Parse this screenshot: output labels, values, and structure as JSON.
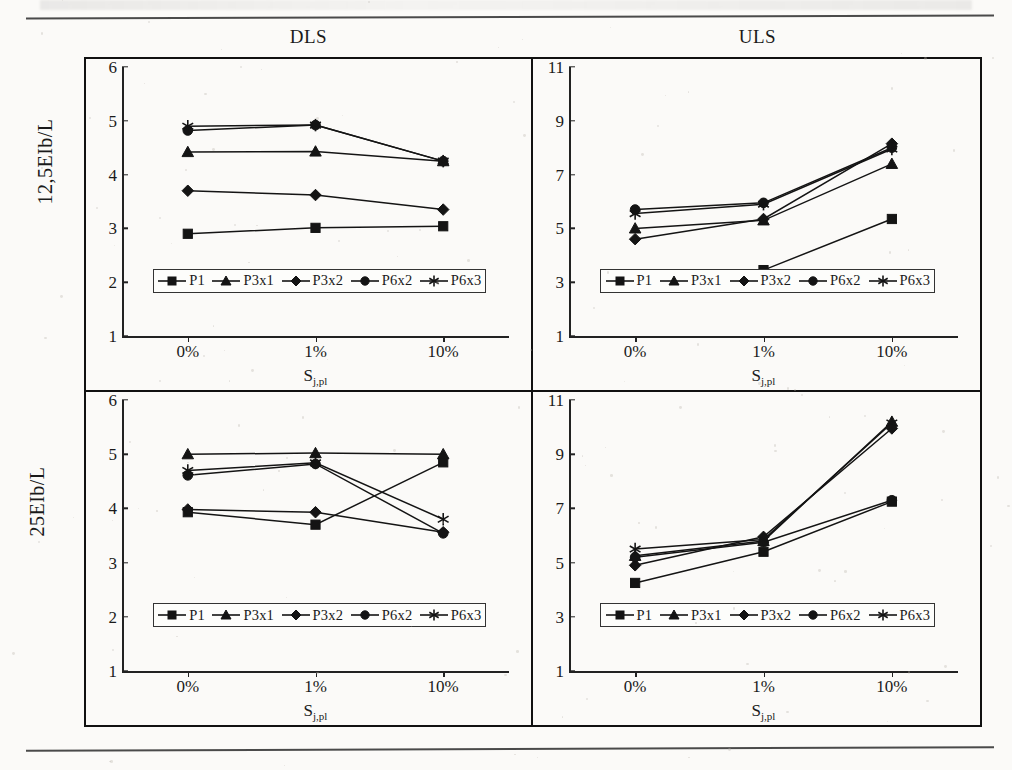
{
  "figure": {
    "column_headers": [
      "DLS",
      "ULS"
    ],
    "row_labels": [
      "12,5EIb/L",
      "25EIb/L"
    ],
    "x_axis_title_base": "S",
    "x_axis_title_sub": "j,pl",
    "categories": [
      "0%",
      "1%",
      "10%"
    ],
    "line_color": "#141414"
  },
  "legend": {
    "items": [
      {
        "label": "P1",
        "marker": "square-marker"
      },
      {
        "label": "P3x1",
        "marker": "triangle-marker"
      },
      {
        "label": "P3x2",
        "marker": "diamond-marker"
      },
      {
        "label": "P6x2",
        "marker": "circle-marker"
      },
      {
        "label": "P6x3",
        "marker": "asterisk-marker"
      }
    ]
  },
  "chart_data": [
    {
      "type": "line",
      "title": "DLS",
      "panel": "top-left",
      "ylabel": "12,5EIb/L",
      "xlabel": "Sj,pl",
      "categories": [
        "0%",
        "1%",
        "10%"
      ],
      "yticks": [
        1,
        2,
        3,
        4,
        5,
        6
      ],
      "ylim": [
        1,
        6
      ],
      "grid": false,
      "legend_position": "inside-bottom",
      "series": [
        {
          "name": "P1",
          "marker": "square",
          "values": [
            2.9,
            3.01,
            3.04
          ]
        },
        {
          "name": "P3x1",
          "marker": "triangle",
          "values": [
            4.42,
            4.43,
            4.25
          ]
        },
        {
          "name": "P3x2",
          "marker": "diamond",
          "values": [
            3.7,
            3.62,
            3.35
          ]
        },
        {
          "name": "P6x2",
          "marker": "circle",
          "values": [
            4.82,
            4.92,
            4.25
          ]
        },
        {
          "name": "P6x3",
          "marker": "asterisk",
          "values": [
            4.9,
            4.92,
            4.25
          ]
        }
      ]
    },
    {
      "type": "line",
      "title": "ULS",
      "panel": "top-right",
      "ylabel": "12,5EIb/L",
      "xlabel": "Sj,pl",
      "categories": [
        "0%",
        "1%",
        "10%"
      ],
      "yticks": [
        1,
        3,
        5,
        7,
        9,
        11
      ],
      "ylim": [
        1,
        11
      ],
      "grid": false,
      "legend_position": "inside-bottom",
      "series": [
        {
          "name": "P1",
          "marker": "square",
          "values": [
            3.25,
            3.45,
            5.35
          ]
        },
        {
          "name": "P3x1",
          "marker": "triangle",
          "values": [
            5.0,
            5.3,
            7.4
          ]
        },
        {
          "name": "P3x2",
          "marker": "diamond",
          "values": [
            4.6,
            5.35,
            8.15
          ]
        },
        {
          "name": "P6x2",
          "marker": "circle",
          "values": [
            5.7,
            5.95,
            8.0
          ]
        },
        {
          "name": "P6x3",
          "marker": "asterisk",
          "values": [
            5.55,
            5.9,
            7.95
          ]
        }
      ]
    },
    {
      "type": "line",
      "title": "DLS",
      "panel": "bottom-left",
      "ylabel": "25EIb/L",
      "xlabel": "Sj,pl",
      "categories": [
        "0%",
        "1%",
        "10%"
      ],
      "yticks": [
        1,
        2,
        3,
        4,
        5,
        6
      ],
      "ylim": [
        1,
        6
      ],
      "grid": false,
      "legend_position": "inside-bottom",
      "series": [
        {
          "name": "P1",
          "marker": "square",
          "values": [
            3.93,
            3.7,
            4.85
          ]
        },
        {
          "name": "P3x1",
          "marker": "triangle",
          "values": [
            5.0,
            5.02,
            5.0
          ]
        },
        {
          "name": "P3x2",
          "marker": "diamond",
          "values": [
            3.98,
            3.93,
            3.56
          ]
        },
        {
          "name": "P6x2",
          "marker": "circle",
          "values": [
            4.61,
            4.82,
            3.54
          ]
        },
        {
          "name": "P6x3",
          "marker": "asterisk",
          "values": [
            4.7,
            4.84,
            3.8
          ]
        }
      ]
    },
    {
      "type": "line",
      "title": "ULS",
      "panel": "bottom-right",
      "ylabel": "25EIb/L",
      "xlabel": "Sj,pl",
      "categories": [
        "0%",
        "1%",
        "10%"
      ],
      "yticks": [
        1,
        3,
        5,
        7,
        9,
        11
      ],
      "ylim": [
        1,
        11
      ],
      "grid": false,
      "legend_position": "inside-bottom",
      "series": [
        {
          "name": "P1",
          "marker": "square",
          "values": [
            4.25,
            5.4,
            7.25
          ]
        },
        {
          "name": "P3x1",
          "marker": "triangle",
          "values": [
            5.25,
            5.8,
            10.2
          ]
        },
        {
          "name": "P3x2",
          "marker": "diamond",
          "values": [
            4.9,
            5.95,
            9.95
          ]
        },
        {
          "name": "P6x2",
          "marker": "circle",
          "values": [
            5.2,
            5.75,
            7.3
          ]
        },
        {
          "name": "P6x3",
          "marker": "asterisk",
          "values": [
            5.5,
            5.85,
            10.15
          ]
        }
      ]
    }
  ]
}
